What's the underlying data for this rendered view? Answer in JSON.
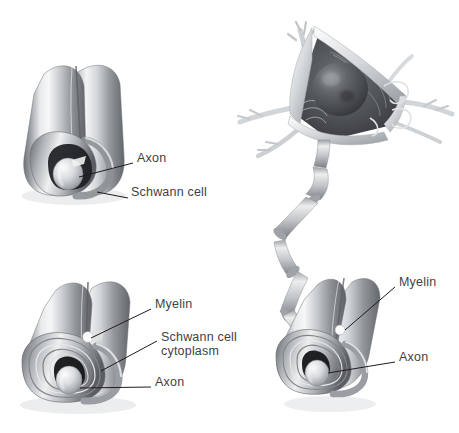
{
  "figure": {
    "background_color": "#ffffff",
    "label_color": "#3f3f44",
    "leader_color": "#1d1d20"
  },
  "panels": [
    {
      "id": "panel-top-left",
      "name": "single-wrap-schwann-cell",
      "description": "Schwann cell wrapped once around an axon, cut-away end view",
      "labels": [
        {
          "id": "tl-axon",
          "text": "Axon",
          "x": 137,
          "y": 157
        },
        {
          "id": "tl-schwann",
          "text": "Schwann cell",
          "x": 131,
          "y": 191
        }
      ]
    },
    {
      "id": "panel-bottom-left",
      "name": "multi-wrap-myelin-sheath",
      "description": "Schwann cell wrapped many times forming compact myelin, cut-away end view",
      "labels": [
        {
          "id": "bl-myelin",
          "text": "Myelin",
          "x": 155,
          "y": 303
        },
        {
          "id": "bl-schwann-cyto-1",
          "text": "Schwann cell",
          "x": 161,
          "y": 336
        },
        {
          "id": "bl-schwann-cyto-2",
          "text": "cytoplasm",
          "x": 161,
          "y": 350
        },
        {
          "id": "bl-axon",
          "text": "Axon",
          "x": 155,
          "y": 381
        }
      ]
    },
    {
      "id": "panel-right",
      "name": "neuron-with-myelinated-axon",
      "description": "Neuron cell body with dendrites and nucleus, axon descending with nodes of Ranvier into a myelinated segment",
      "labels": [
        {
          "id": "r-myelin",
          "text": "Myelin",
          "x": 399,
          "y": 281
        },
        {
          "id": "r-axon",
          "text": "Axon",
          "x": 399,
          "y": 356
        }
      ]
    }
  ]
}
